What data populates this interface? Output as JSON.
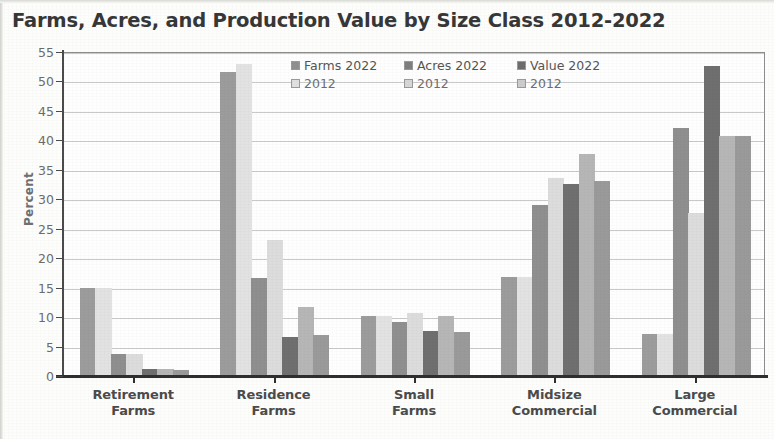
{
  "chart_data": {
    "type": "bar",
    "title": "Farms, Acres, and Production Value by Size Class 2012-2022",
    "xlabel": "",
    "ylabel": "Percent",
    "ylim": [
      0,
      55
    ],
    "ytick_step": 5,
    "yticks": [
      "55",
      "50",
      "45",
      "40",
      "35",
      "30",
      "25",
      "20",
      "15",
      "10",
      "5",
      "0"
    ],
    "grid": true,
    "legend_position": "top-center-inside",
    "categories": [
      "Retirement Farms",
      "Residence Farms",
      "Small Farms",
      "Midsize Commercial",
      "Large Commercial"
    ],
    "category_lines": [
      [
        "Retirement",
        "Farms"
      ],
      [
        "Residence",
        "Farms"
      ],
      [
        "Small",
        "Farms"
      ],
      [
        "Midsize",
        "Commercial"
      ],
      [
        "Large",
        "Commercial"
      ]
    ],
    "series": [
      {
        "name": "Farms 2022",
        "color": "#9c9c9c",
        "values": [
          14.8,
          51.5,
          10.0,
          16.7,
          7.0
        ]
      },
      {
        "name": "Farms 2012",
        "color": "#e2e2e2",
        "values": [
          14.8,
          52.8,
          10.0,
          16.7,
          7.0
        ]
      },
      {
        "name": "Acres 2022",
        "color": "#8f8f8f",
        "values": [
          3.5,
          16.5,
          9.0,
          28.8,
          42.0
        ]
      },
      {
        "name": "Acres 2012",
        "color": "#dcdcdc",
        "values": [
          3.5,
          23.0,
          10.5,
          33.5,
          27.5
        ]
      },
      {
        "name": "Value 2022",
        "color": "#6f6f6f",
        "values": [
          1.0,
          6.5,
          7.5,
          32.5,
          52.5
        ]
      },
      {
        "name": "Value 2012",
        "color": "#b6b6b6",
        "values": [
          1.0,
          11.5,
          10.0,
          37.5,
          40.5
        ]
      },
      {
        "name": "Value 2012 b",
        "color": "#9a9a9a",
        "values": [
          0.8,
          6.8,
          7.3,
          33.0,
          40.5
        ]
      }
    ]
  },
  "legend": {
    "row1": [
      {
        "label": "Farms 2022",
        "color": "#8f8f8f"
      },
      {
        "label": "Acres 2022",
        "color": "#7e7e7e"
      },
      {
        "label": "Value 2022",
        "color": "#6d6d6d"
      }
    ],
    "row2": [
      {
        "label": "2012",
        "color": "#e0e0e0"
      },
      {
        "label": "2012",
        "color": "#d6d6d6"
      },
      {
        "label": "2012",
        "color": "#cccccc"
      }
    ]
  },
  "colors": {
    "axis": "#2f2f2f",
    "grid": "#c9c9c9",
    "title_text": "#373737",
    "tick_text": "#6c6c6c",
    "plot_border": "#8e8e8e",
    "background": "#fdfdfc"
  }
}
